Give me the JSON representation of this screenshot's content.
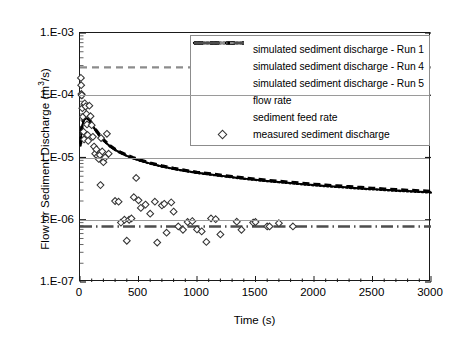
{
  "chart_data": {
    "type": "line",
    "title": "",
    "xlabel": "Time (s)",
    "ylabel": "Flow or Sediment Discharge (m3/s)",
    "ylabel_parts": {
      "pre": "Flow or Sediment Discharge (m",
      "sup": "3",
      "post": "/s)"
    },
    "yscale": "log",
    "xlim": [
      0,
      3000
    ],
    "ylim": [
      1e-07,
      0.001
    ],
    "xticks": [
      0,
      500,
      1000,
      1500,
      2000,
      2500,
      3000
    ],
    "xtick_labels": [
      "0",
      "500",
      "1000",
      "1500",
      "2000",
      "2500",
      "3000"
    ],
    "yticks": [
      0.001,
      0.0001,
      1e-05,
      1e-06,
      1e-07
    ],
    "ytick_labels": [
      "1.E-03",
      "1.E-04",
      "1.E-05",
      "1.E-06",
      "1.E-07"
    ],
    "grid": "horizontal-major",
    "legend_position": "top-right-inside",
    "series": [
      {
        "name": "simulated sediment discharge - Run 1",
        "style": "solid",
        "color": "#000000",
        "x": [
          5,
          15,
          30,
          50,
          75,
          100,
          130,
          160,
          200,
          250,
          300,
          350,
          400,
          450,
          500,
          600,
          700,
          800,
          900,
          1000,
          1100,
          1200,
          1300,
          1400,
          1500,
          1600,
          1700,
          1800,
          1900,
          2000,
          2100,
          2200,
          2300,
          2400,
          2500,
          2600,
          2700,
          2800,
          2900,
          3000
        ],
        "y": [
          1.6e-05,
          3e-05,
          4e-05,
          4.4e-05,
          4.1e-05,
          3.5e-05,
          2.8e-05,
          2.35e-05,
          1.9e-05,
          1.55e-05,
          1.33e-05,
          1.18e-05,
          1.07e-05,
          9.8e-06,
          9.1e-06,
          8e-06,
          7.2e-06,
          6.6e-06,
          6.1e-06,
          5.7e-06,
          5.4e-06,
          5.1e-06,
          4.85e-06,
          4.6e-06,
          4.4e-06,
          4.2e-06,
          4.05e-06,
          3.9e-06,
          3.75e-06,
          3.62e-06,
          3.5e-06,
          3.4e-06,
          3.3e-06,
          3.2e-06,
          3.12e-06,
          3.04e-06,
          2.97e-06,
          2.9e-06,
          2.84e-06,
          2.78e-06
        ]
      },
      {
        "name": "simulated sediment discharge - Run 4",
        "style": "dotted",
        "color": "#000000",
        "x": [
          5,
          15,
          30,
          50,
          75,
          100,
          130,
          160,
          200,
          250,
          300,
          350,
          400,
          450,
          500,
          600,
          700,
          800,
          900,
          1000,
          1100,
          1200,
          1300,
          1400,
          1500,
          1600,
          1700,
          1800,
          1900,
          2000,
          2100,
          2200,
          2300,
          2400,
          2500,
          2600,
          2700,
          2800,
          2900,
          3000
        ],
        "y": [
          1.55e-05,
          2.9e-05,
          3.9e-05,
          4.3e-05,
          4.05e-05,
          3.45e-05,
          2.78e-05,
          2.3e-05,
          1.88e-05,
          1.54e-05,
          1.32e-05,
          1.17e-05,
          1.06e-05,
          9.7e-06,
          9e-06,
          7.95e-06,
          7.15e-06,
          6.55e-06,
          6.05e-06,
          5.65e-06,
          5.35e-06,
          5.05e-06,
          4.8e-06,
          4.55e-06,
          4.35e-06,
          4.15e-06,
          4e-06,
          3.85e-06,
          3.7e-06,
          3.57e-06,
          3.45e-06,
          3.35e-06,
          3.25e-06,
          3.15e-06,
          3.07e-06,
          2.99e-06,
          2.92e-06,
          2.85e-06,
          2.79e-06,
          2.73e-06
        ]
      },
      {
        "name": "simulated sediment discharge - Run 5",
        "style": "dashed",
        "color": "#000000",
        "x": [
          5,
          15,
          30,
          50,
          75,
          100,
          130,
          160,
          200,
          250,
          300,
          350,
          400,
          450,
          500,
          600,
          700,
          800,
          900,
          1000,
          1100,
          1200,
          1300,
          1400,
          1500,
          1600,
          1700,
          1800,
          1900,
          2000,
          2100,
          2200,
          2300,
          2400,
          2500,
          2600,
          2700,
          2800,
          2900,
          3000
        ],
        "y": [
          1.65e-05,
          3.1e-05,
          4.1e-05,
          4.5e-05,
          4.15e-05,
          3.55e-05,
          2.85e-05,
          2.4e-05,
          1.93e-05,
          1.57e-05,
          1.35e-05,
          1.2e-05,
          1.09e-05,
          1e-05,
          9.25e-06,
          8.15e-06,
          7.35e-06,
          6.7e-06,
          6.2e-06,
          5.8e-06,
          5.5e-06,
          5.2e-06,
          4.95e-06,
          4.7e-06,
          4.5e-06,
          4.3e-06,
          4.15e-06,
          4e-06,
          3.85e-06,
          3.72e-06,
          3.6e-06,
          3.5e-06,
          3.4e-06,
          3.3e-06,
          3.2e-06,
          3.12e-06,
          3.05e-06,
          2.98e-06,
          2.92e-06,
          2.86e-06
        ]
      },
      {
        "name": "flow rate",
        "style": "dashed-gray",
        "color": "#8c8c8c",
        "constant": 0.00028
      },
      {
        "name": "sediment feed rate",
        "style": "dash-dot",
        "color": "#4d4d4d",
        "constant": 7.8e-07
      },
      {
        "name": "measured sediment discharge",
        "style": "marker-diamond",
        "color": "#333333",
        "points": [
          [
            8,
            0.00019
          ],
          [
            10,
            0.000145
          ],
          [
            12,
            0.000105
          ],
          [
            15,
            0.0001
          ],
          [
            20,
            6.2e-05
          ],
          [
            25,
            4.5e-05
          ],
          [
            30,
            2.6e-05
          ],
          [
            35,
            1.95e-05
          ],
          [
            40,
            7.4e-05
          ],
          [
            48,
            6.6e-05
          ],
          [
            55,
            5e-05
          ],
          [
            60,
            3.4e-05
          ],
          [
            65,
            2.3e-05
          ],
          [
            70,
            1.85e-05
          ],
          [
            80,
            6.8e-05
          ],
          [
            90,
            4.6e-05
          ],
          [
            100,
            3.3e-05
          ],
          [
            110,
            2.15e-05
          ],
          [
            120,
            1.5e-05
          ],
          [
            130,
            1.15e-05
          ],
          [
            140,
            1.35e-05
          ],
          [
            150,
            1.05e-05
          ],
          [
            160,
            9.5e-06
          ],
          [
            170,
            1.1e-05
          ],
          [
            180,
            2.05e-05
          ],
          [
            190,
            1.25e-05
          ],
          [
            200,
            8.4e-06
          ],
          [
            215,
            1e-05
          ],
          [
            230,
            2.4e-05
          ],
          [
            245,
            1.15e-05
          ],
          [
            175,
            3.6e-06
          ],
          [
            300,
            2e-06
          ],
          [
            330,
            1.95e-06
          ],
          [
            350,
            9e-07
          ],
          [
            380,
            1e-06
          ],
          [
            400,
            4.6e-07
          ],
          [
            420,
            1e-06
          ],
          [
            440,
            1.05e-06
          ],
          [
            460,
            2.3e-06
          ],
          [
            480,
            4.7e-06
          ],
          [
            500,
            2.05e-06
          ],
          [
            520,
            1.55e-06
          ],
          [
            560,
            1.75e-06
          ],
          [
            600,
            1.25e-06
          ],
          [
            640,
            1.95e-06
          ],
          [
            660,
            4.3e-07
          ],
          [
            700,
            1.7e-06
          ],
          [
            720,
            1.8e-06
          ],
          [
            740,
            6.2e-07
          ],
          [
            780,
            1.9e-06
          ],
          [
            800,
            1.35e-06
          ],
          [
            840,
            7.8e-07
          ],
          [
            880,
            6.9e-07
          ],
          [
            920,
            9.2e-07
          ],
          [
            960,
            9.5e-07
          ],
          [
            1000,
            7e-07
          ],
          [
            1040,
            6.5e-07
          ],
          [
            1080,
            4.4e-07
          ],
          [
            1120,
            1.05e-06
          ],
          [
            1160,
            1.02e-06
          ],
          [
            1200,
            5.8e-07
          ],
          [
            1340,
            9.3e-07
          ],
          [
            1380,
            6.9e-07
          ],
          [
            1480,
            9e-07
          ],
          [
            1500,
            9.2e-07
          ],
          [
            1600,
            7.8e-07
          ],
          [
            1620,
            7.8e-07
          ],
          [
            1700,
            8.8e-07
          ],
          [
            1820,
            7.8e-07
          ]
        ]
      }
    ]
  },
  "legend": {
    "items": [
      {
        "label": "simulated sediment discharge - Run 1",
        "key": "solid"
      },
      {
        "label": "simulated sediment discharge - Run 4",
        "key": "dotted"
      },
      {
        "label": "simulated sediment discharge - Run 5",
        "key": "dashed"
      },
      {
        "label": "flow rate",
        "key": "dashed-gray"
      },
      {
        "label": "sediment feed rate",
        "key": "dash-dot"
      },
      {
        "label": "measured sediment discharge",
        "key": "diamond"
      }
    ]
  }
}
